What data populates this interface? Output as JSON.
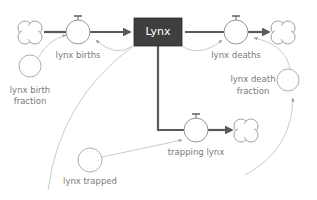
{
  "diagram": {
    "type": "stock-and-flow",
    "colors": {
      "stock_fill": "#3f3f3f",
      "stock_text": "#ffffff",
      "flow_pipe": "#5a5a5a",
      "connector": "#b0b0b0",
      "node_stroke": "#9a9a9a",
      "label_text": "#7a7a7a"
    },
    "stock": {
      "label": "Lynx"
    },
    "flows": {
      "births": {
        "label": "lynx births"
      },
      "deaths": {
        "label": "lynx deaths"
      },
      "trapping": {
        "label": "trapping lynx"
      }
    },
    "auxiliaries": {
      "birth_fraction": {
        "line1": "lynx birth",
        "line2": "fraction"
      },
      "death_fraction": {
        "line1": "lynx death",
        "line2": "fraction"
      },
      "trapped": {
        "label": "lynx trapped"
      }
    },
    "clouds": [
      "source-cloud",
      "sink-cloud-deaths",
      "sink-cloud-trapping"
    ]
  }
}
